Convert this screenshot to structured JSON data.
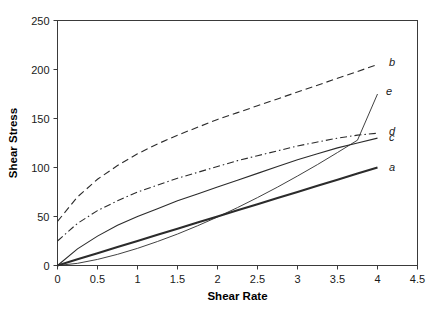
{
  "chart_data": {
    "type": "line",
    "title": "",
    "xlabel": "Shear Rate",
    "ylabel": "Shear Stress",
    "xlim": [
      0,
      4.5
    ],
    "ylim": [
      0,
      250
    ],
    "xticks": [
      "0",
      "0.5",
      "1",
      "1.5",
      "2",
      "2.5",
      "3",
      "3.5",
      "4",
      "4.5"
    ],
    "xtick_values": [
      0,
      0.5,
      1,
      1.5,
      2,
      2.5,
      3,
      3.5,
      4,
      4.5
    ],
    "yticks": [
      "0",
      "50",
      "100",
      "150",
      "200",
      "250"
    ],
    "ytick_values": [
      0,
      50,
      100,
      150,
      200,
      250
    ],
    "grid": false,
    "legend": "inline-end-labels",
    "x": [
      0,
      0.25,
      0.5,
      0.75,
      1,
      1.25,
      1.5,
      1.75,
      2,
      2.25,
      2.5,
      2.75,
      3,
      3.25,
      3.5,
      3.75,
      4
    ],
    "series": [
      {
        "name": "a",
        "label": "a",
        "linestyle": "solid",
        "linewidth": 2.1,
        "color": "#2b2b2b",
        "description": "Newtonian",
        "yield_stress": 0,
        "end_value": 100,
        "values": [
          0,
          6.3,
          12.5,
          18.8,
          25,
          31.3,
          37.5,
          43.8,
          50,
          56.3,
          62.5,
          68.8,
          75,
          81.3,
          87.5,
          93.8,
          100
        ]
      },
      {
        "name": "b",
        "label": "b",
        "linestyle": "dashed",
        "linewidth": 1.1,
        "color": "#2b2b2b",
        "description": "Bingham pseudoplastic with yield stress",
        "yield_stress": 45,
        "end_value": 205,
        "values": [
          45,
          70,
          88,
          102,
          114,
          124,
          133,
          141,
          149,
          156,
          163,
          170,
          177,
          184,
          191,
          198,
          205
        ]
      },
      {
        "name": "c",
        "label": "c",
        "linestyle": "solid",
        "linewidth": 1.1,
        "color": "#2b2b2b",
        "description": "Pseudoplastic shear-thinning",
        "yield_stress": 0,
        "end_value": 130,
        "values": [
          0,
          17,
          30,
          41,
          50,
          58,
          66,
          73,
          80,
          87,
          94,
          101,
          108,
          114,
          120,
          125,
          130
        ]
      },
      {
        "name": "d",
        "label": "d",
        "linestyle": "dash-dot",
        "linewidth": 1.1,
        "color": "#2b2b2b",
        "description": "Pseudoplastic with yield stress",
        "yield_stress": 25,
        "end_value": 135,
        "values": [
          25,
          43,
          56,
          66,
          75,
          82,
          89,
          95,
          101,
          107,
          112,
          117,
          122,
          126,
          130,
          133,
          135
        ]
      },
      {
        "name": "e",
        "label": "e",
        "linestyle": "solid-thin",
        "linewidth": 0.9,
        "color": "#4a4a4a",
        "description": "Dilatant shear-thickening",
        "yield_stress": 0,
        "end_value": 175,
        "values": [
          0,
          2.2,
          6.2,
          11.4,
          17.5,
          24.5,
          32.1,
          40.5,
          49.5,
          59.1,
          69.3,
          80.0,
          91.3,
          103.0,
          115.3,
          127.9,
          175
        ]
      }
    ],
    "curve_label_positions": [
      {
        "label": "a",
        "x": 4.12,
        "y": 101
      },
      {
        "label": "b",
        "x": 4.12,
        "y": 208
      },
      {
        "label": "c",
        "x": 4.12,
        "y": 131
      },
      {
        "label": "d",
        "x": 4.12,
        "y": 137
      },
      {
        "label": "e",
        "x": 4.08,
        "y": 178
      }
    ]
  }
}
